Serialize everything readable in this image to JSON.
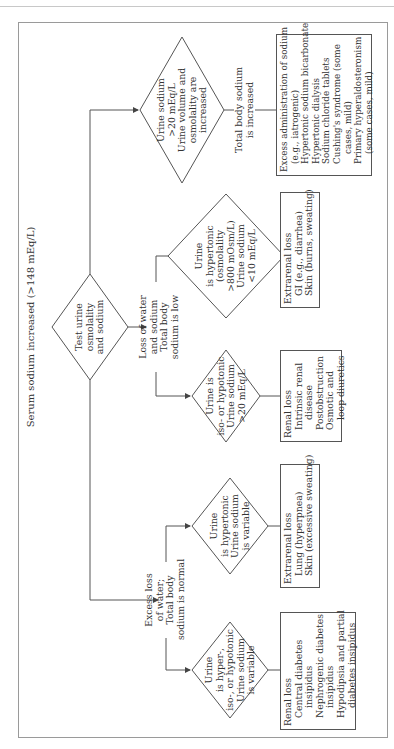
{
  "title": "Serum sodium increased (>148 mEq/L)",
  "start": {
    "label": "Test urine\nosmolality\nand sodium",
    "lines": [
      "Test urine",
      "osmolality",
      "and sodium"
    ]
  },
  "branches": {
    "normal": {
      "label_lines": [
        "Excess loss",
        "of water;",
        "Total body",
        "sodium is normal"
      ],
      "diamonds": [
        {
          "lines": [
            "Urine",
            "is hyper-,",
            "iso-, or hypotonic",
            "Urine sodium",
            "is variable"
          ],
          "box": {
            "heading": "Renal loss",
            "items": [
              "Central diabetes",
              "insipidus",
              "Nephrogenic diabetes",
              "insipidus",
              "Hypodipsia and partial",
              "diabetes insipidus"
            ]
          }
        },
        {
          "lines": [
            "Urine",
            "is hypertonic",
            "Urine sodium",
            "is variable"
          ],
          "box": {
            "heading": "Extrarenal loss",
            "items": [
              "Lung (hyperpnea)",
              "Skin (excessive sweating)"
            ]
          }
        }
      ]
    },
    "low": {
      "label_lines": [
        "Loss of water",
        "and sodium",
        "Total body",
        "sodium is low"
      ],
      "diamonds": [
        {
          "lines": [
            "Urine is",
            "iso- or hypotonic",
            "Urine sodium",
            ">20 mEq/L"
          ],
          "box": {
            "heading": "Renal loss",
            "items": [
              "Intrinsic renal",
              "disease",
              "Postobstruction",
              "Osmotic and",
              "loop diuretics"
            ]
          }
        },
        {
          "lines": [
            "Urine",
            "is hypertonic",
            "(osmolality",
            ">800 mOsm/L)",
            "Urine sodium",
            "<10 mEq/L"
          ],
          "box": {
            "heading": "Extrarenal loss",
            "items": [
              "GI (e.g., diarrhea)",
              "Skin (burns, sweating)"
            ]
          }
        }
      ]
    },
    "increased": {
      "diamond_lines": [
        "Urine sodium",
        ">20 mEq/L",
        "Urine volume and",
        "osmolality are",
        "increased"
      ],
      "label_lines": [
        "Total body sodium",
        "is increased"
      ],
      "box": {
        "heading": "Excess administration of sodium",
        "items": [
          "(e.g., iatrogenic)",
          "Hypertonic sodium bicarbonate",
          "Hypertonic dialysis",
          "Sodium chloride tablets",
          "Cushing's syndrome (some",
          "cases, mild)",
          "Primary hyperaldosteronism",
          "(some cases, mild)"
        ]
      }
    }
  },
  "colors": {
    "line": "#555555",
    "frame": "#9a9a9a",
    "text": "#333333"
  }
}
